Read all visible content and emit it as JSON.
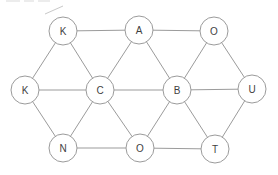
{
  "diagram": {
    "type": "graph",
    "background_color": "#ffffff",
    "node_fill": "#ffffff",
    "node_stroke": "#9b9b9b",
    "edge_color": "#9b9b9b",
    "label_color": "#3f3f3f",
    "node_radius": 14,
    "nodes": [
      {
        "id": "k1",
        "label": "K",
        "x": 63,
        "y": 31
      },
      {
        "id": "a",
        "label": "A",
        "x": 139,
        "y": 30
      },
      {
        "id": "o1",
        "label": "O",
        "x": 214,
        "y": 31
      },
      {
        "id": "k2",
        "label": "K",
        "x": 25,
        "y": 90
      },
      {
        "id": "c",
        "label": "C",
        "x": 100,
        "y": 90
      },
      {
        "id": "b",
        "label": "B",
        "x": 177,
        "y": 90
      },
      {
        "id": "u",
        "label": "U",
        "x": 252,
        "y": 89
      },
      {
        "id": "n",
        "label": "N",
        "x": 63,
        "y": 148
      },
      {
        "id": "o2",
        "label": "O",
        "x": 140,
        "y": 148
      },
      {
        "id": "t",
        "label": "T",
        "x": 215,
        "y": 149
      }
    ],
    "edges": [
      [
        "k1",
        "a"
      ],
      [
        "a",
        "o1"
      ],
      [
        "k2",
        "k1"
      ],
      [
        "k1",
        "c"
      ],
      [
        "a",
        "c"
      ],
      [
        "a",
        "b"
      ],
      [
        "o1",
        "b"
      ],
      [
        "o1",
        "u"
      ],
      [
        "k2",
        "c"
      ],
      [
        "c",
        "b"
      ],
      [
        "b",
        "u"
      ],
      [
        "k2",
        "n"
      ],
      [
        "c",
        "n"
      ],
      [
        "c",
        "o2"
      ],
      [
        "b",
        "o2"
      ],
      [
        "b",
        "t"
      ],
      [
        "u",
        "t"
      ],
      [
        "n",
        "o2"
      ],
      [
        "o2",
        "t"
      ]
    ],
    "artifacts": {
      "color_faint": "#d9d9d9",
      "color_diagonal": "#c8c8c8",
      "top_dashes": [
        {
          "x1": 6,
          "y1": 1,
          "x2": 20,
          "y2": 1
        },
        {
          "x1": 24,
          "y1": 1,
          "x2": 34,
          "y2": 1
        },
        {
          "x1": 38,
          "y1": 1,
          "x2": 50,
          "y2": 1
        }
      ],
      "diagonal": {
        "x1": 45,
        "y1": 14,
        "x2": 63,
        "y2": 6
      }
    }
  }
}
